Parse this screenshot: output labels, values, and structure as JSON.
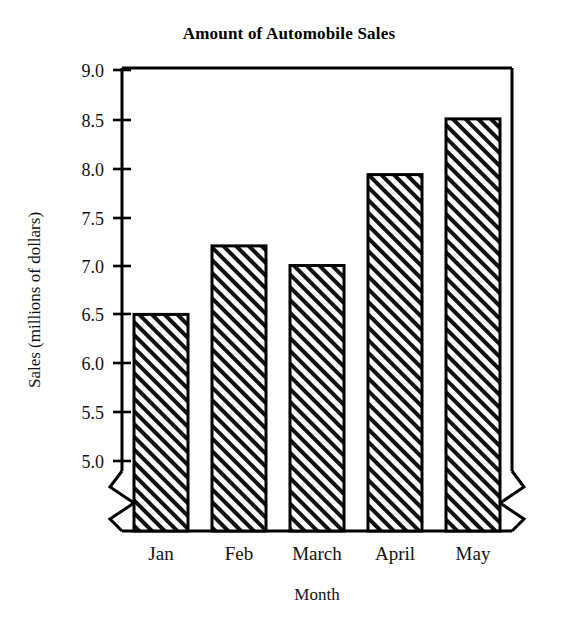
{
  "chart_data": {
    "type": "bar",
    "title": "Amount of Automobile Sales",
    "xlabel": "Month",
    "ylabel": "Sales (millions of dollars)",
    "categories": [
      "Jan",
      "Feb",
      "March",
      "April",
      "May"
    ],
    "values": [
      6.5,
      7.2,
      7.0,
      7.93,
      8.5
    ],
    "ytick_labels": [
      "9.0",
      "8.5",
      "8.0",
      "7.5",
      "7.0",
      "6.5",
      "6.0",
      "5.5",
      "5.0"
    ],
    "ytick_values": [
      9.0,
      8.5,
      8.0,
      7.5,
      7.0,
      6.5,
      6.0,
      5.5,
      5.0
    ],
    "ylim": [
      5.0,
      9.0
    ],
    "grid": false,
    "legend": null,
    "axis_break": "zigzag break on vertical axes below 5.0 and at both ends of the baseline",
    "bar_fill": "diagonal-hatch",
    "colors": {
      "ink": "#000000",
      "background": "#ffffff",
      "bar_stroke": "#000000",
      "bar_hatch": "#000000"
    }
  }
}
